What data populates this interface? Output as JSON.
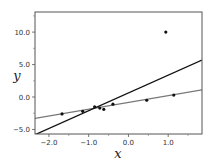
{
  "chart_data": {
    "type": "scatter",
    "title": "",
    "xlabel": "x",
    "ylabel": "y",
    "xlim": [
      -2.35,
      1.85
    ],
    "ylim": [
      -5.7,
      13.1
    ],
    "grid": false,
    "legend": null,
    "xticks": [
      {
        "value": -2.0,
        "label": "−2.0"
      },
      {
        "value": -1.0,
        "label": "−1.0"
      },
      {
        "value": 0.0,
        "label": "0.0"
      },
      {
        "value": 1.0,
        "label": "1.0"
      }
    ],
    "xminor_ticks": [
      -1.5,
      -0.5,
      0.5,
      1.5
    ],
    "yticks": [
      {
        "value": -5.0,
        "label": "−5.0"
      },
      {
        "value": 0.0,
        "label": "0.0"
      },
      {
        "value": 5.0,
        "label": "5.0"
      },
      {
        "value": 10.0,
        "label": "10.0"
      }
    ],
    "yminor_ticks": [
      -2.5,
      2.5,
      7.5,
      12.5
    ],
    "series": [
      {
        "name": "data points",
        "kind": "scatter",
        "color": "#111111",
        "points": [
          {
            "x": -1.67,
            "y": -2.6
          },
          {
            "x": -1.15,
            "y": -2.2
          },
          {
            "x": -0.85,
            "y": -1.5
          },
          {
            "x": -0.72,
            "y": -1.7
          },
          {
            "x": -0.62,
            "y": -1.9
          },
          {
            "x": -0.39,
            "y": -1.1
          },
          {
            "x": 0.46,
            "y": -0.5
          },
          {
            "x": 1.14,
            "y": 0.3
          },
          {
            "x": 0.94,
            "y": 10.0
          }
        ]
      },
      {
        "name": "robust fit",
        "kind": "line",
        "color": "#777777",
        "points": [
          {
            "x": -2.35,
            "y": -3.3
          },
          {
            "x": 1.85,
            "y": 1.1
          }
        ]
      },
      {
        "name": "least-squares fit",
        "kind": "line",
        "color": "#111111",
        "points": [
          {
            "x": -2.35,
            "y": -5.8
          },
          {
            "x": 1.85,
            "y": 5.7
          }
        ]
      }
    ]
  }
}
